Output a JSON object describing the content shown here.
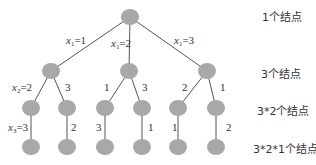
{
  "diagram": {
    "type": "search-tree",
    "node_color": "#a8a8a8",
    "edge_color": "#555555",
    "levels": [
      {
        "label": "1个结点"
      },
      {
        "label": "3个结点"
      },
      {
        "label": "3*2个结点"
      },
      {
        "label": "3*2*1个结点"
      }
    ],
    "edge_labels": {
      "root_left": {
        "var": "x",
        "sub": "1",
        "val": "=1"
      },
      "root_mid": {
        "var": "x",
        "sub": "1",
        "val": "=2"
      },
      "root_right": {
        "var": "x",
        "sub": "1",
        "val": "=3"
      },
      "l2_0_left": {
        "var": "x",
        "sub": "2",
        "val": "=2"
      },
      "l2_0_right": "3",
      "l2_1_left": "1",
      "l2_1_right": "3",
      "l2_2_left": "2",
      "l2_2_right": "1",
      "l3_0": {
        "var": "x",
        "sub": "3",
        "val": "=3"
      },
      "l3_1": "2",
      "l3_2": "3",
      "l3_3": "1",
      "l3_4": "1",
      "l3_5": "2"
    }
  }
}
